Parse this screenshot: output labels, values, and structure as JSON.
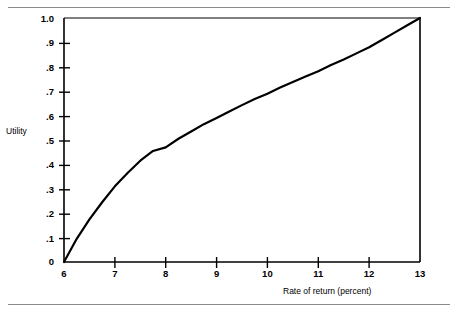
{
  "figure": {
    "clipped_header_text": "",
    "rules": {
      "top_label": "top-divider-rule",
      "bottom_label": "bottom-divider-rule"
    }
  },
  "chart_data": {
    "type": "line",
    "title": "",
    "subtitle": "",
    "xlabel": "Rate of return (percent)",
    "ylabel": "Utility",
    "xlim": [
      6,
      13
    ],
    "ylim": [
      0,
      1.0
    ],
    "grid": false,
    "legend": null,
    "x_tick_labels": [
      "6",
      "7",
      "8",
      "9",
      "10",
      "11",
      "12",
      "13"
    ],
    "x_ticks": [
      6,
      7,
      8,
      9,
      10,
      11,
      12,
      13
    ],
    "y_tick_labels": [
      "0",
      ".1",
      ".2",
      ".3",
      ".4",
      ".5",
      ".6",
      ".7",
      ".8",
      ".9",
      "1.0"
    ],
    "y_ticks": [
      0,
      0.1,
      0.2,
      0.3,
      0.4,
      0.5,
      0.6,
      0.7,
      0.8,
      0.9,
      1.0
    ],
    "line_color": "#000000",
    "line_width": 2.2,
    "series": [
      {
        "name": "Utility of rate of return",
        "x": [
          6.0,
          6.25,
          6.5,
          6.75,
          7.0,
          7.25,
          7.5,
          7.75,
          8.0,
          8.25,
          8.5,
          8.75,
          9.0,
          9.25,
          9.5,
          9.75,
          10.0,
          10.25,
          10.5,
          10.75,
          11.0,
          11.25,
          11.5,
          11.75,
          12.0,
          12.25,
          12.5,
          12.75,
          13.0
        ],
        "values": [
          0.0,
          0.095,
          0.175,
          0.245,
          0.31,
          0.365,
          0.415,
          0.455,
          0.47,
          0.505,
          0.535,
          0.565,
          0.59,
          0.617,
          0.643,
          0.668,
          0.69,
          0.715,
          0.738,
          0.76,
          0.782,
          0.807,
          0.83,
          0.855,
          0.88,
          0.91,
          0.94,
          0.97,
          1.0
        ]
      }
    ],
    "annotations": [
      {
        "label": "terminal-vertical-line",
        "x": 13,
        "y0": 0,
        "y1": 1.0
      },
      {
        "label": "plot-top-border",
        "y": 1.0
      }
    ]
  }
}
